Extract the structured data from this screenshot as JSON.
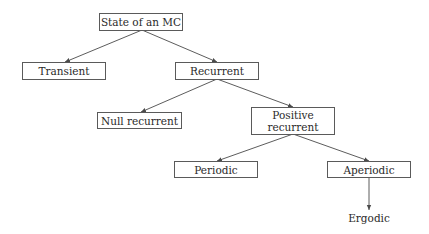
{
  "diagram": {
    "type": "tree",
    "colors": {
      "background": "#ffffff",
      "line": "#4a4a4a",
      "border": "#5a5a5a",
      "text": "#2a2a2a"
    },
    "nodes": {
      "root": {
        "label": "State of an MC"
      },
      "transient": {
        "label": "Transient"
      },
      "recurrent": {
        "label": "Recurrent"
      },
      "null_recurrent": {
        "label": "Null recurrent"
      },
      "positive_recurrent": {
        "line1": "Positive",
        "line2": "recurrent"
      },
      "periodic": {
        "label": "Periodic"
      },
      "aperiodic": {
        "label": "Aperiodic"
      },
      "ergodic": {
        "label": "Ergodic"
      }
    },
    "edges": [
      {
        "from": "State of an MC",
        "to": "Transient"
      },
      {
        "from": "State of an MC",
        "to": "Recurrent"
      },
      {
        "from": "Recurrent",
        "to": "Null recurrent"
      },
      {
        "from": "Recurrent",
        "to": "Positive recurrent"
      },
      {
        "from": "Positive recurrent",
        "to": "Periodic"
      },
      {
        "from": "Positive recurrent",
        "to": "Aperiodic"
      },
      {
        "from": "Aperiodic",
        "to": "Ergodic"
      }
    ]
  }
}
